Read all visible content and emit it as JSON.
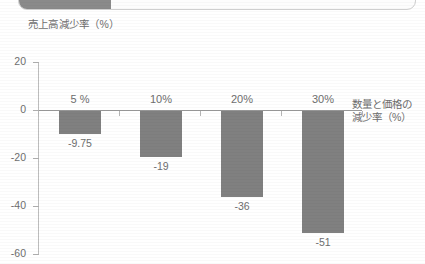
{
  "top_strip": {
    "name": "cropped-toolbar-strip",
    "fill_color": "#8a8a8a",
    "border_color": "#cfcfcf"
  },
  "chart_data": {
    "type": "bar",
    "title": "",
    "ylabel": "売上高減少率（%）",
    "xlabel": "数量と価格の\n減少率（%）",
    "xlabel_line1": "数量と価格の",
    "xlabel_line2": "減少率（%）",
    "categories": [
      "5 %",
      "10%",
      "20%",
      "30%"
    ],
    "values": [
      -9.75,
      -19,
      -36,
      -51
    ],
    "value_labels": [
      "-9.75",
      "-19",
      "-36",
      "-51"
    ],
    "ylim": [
      -60,
      20
    ],
    "ytick_labels": [
      "20",
      "0",
      "-20",
      "-40",
      "-60"
    ],
    "ytick_values": [
      20,
      0,
      -20,
      -40,
      -60
    ],
    "grid": false,
    "legend": false,
    "bar_color": "#808080",
    "axis_color": "#9a9a9a",
    "text_color": "#6e6e6e"
  }
}
